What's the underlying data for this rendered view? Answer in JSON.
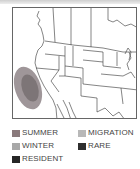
{
  "map": {
    "region": "Western North America",
    "range_shading": "summer/resident range along California coast"
  },
  "legend": {
    "items": [
      {
        "key": "summer",
        "label": "SUMMER",
        "color": "#8a7a7c"
      },
      {
        "key": "migration",
        "label": "MIGRATION",
        "color": "#b8b8b8"
      },
      {
        "key": "winter",
        "label": "WINTER",
        "color": "#a8a8a8"
      },
      {
        "key": "rare",
        "label": "RARE",
        "color": "#2e2e2e"
      },
      {
        "key": "resident",
        "label": "RESIDENT",
        "color": "#262626"
      }
    ]
  }
}
